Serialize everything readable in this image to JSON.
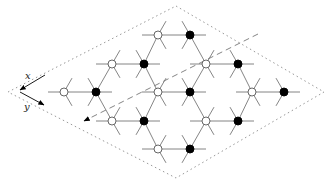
{
  "diagram": {
    "type": "honeycomb-lattice",
    "axis_labels": {
      "x": "x",
      "y": "y"
    },
    "colors": {
      "edge": "#777777",
      "boundary": "#999999",
      "dashed_line": "#777777",
      "filled_node": "#000000",
      "open_node_fill": "#ffffff",
      "open_node_stroke": "#555555",
      "arrow": "#000000"
    },
    "boundary_rhombus": [
      [
        176,
        6
      ],
      [
        324,
        92
      ],
      [
        176,
        178
      ],
      [
        8,
        92
      ]
    ],
    "nodes": [
      {
        "x": 158,
        "y": 35,
        "filled": false
      },
      {
        "x": 190,
        "y": 35,
        "filled": true
      },
      {
        "x": 112,
        "y": 64,
        "filled": false
      },
      {
        "x": 144,
        "y": 64,
        "filled": true
      },
      {
        "x": 206,
        "y": 64,
        "filled": false
      },
      {
        "x": 238,
        "y": 64,
        "filled": true
      },
      {
        "x": 64,
        "y": 92,
        "filled": false
      },
      {
        "x": 96,
        "y": 92,
        "filled": true
      },
      {
        "x": 158,
        "y": 92,
        "filled": false
      },
      {
        "x": 190,
        "y": 92,
        "filled": true
      },
      {
        "x": 252,
        "y": 92,
        "filled": false
      },
      {
        "x": 284,
        "y": 92,
        "filled": true
      },
      {
        "x": 112,
        "y": 121,
        "filled": false
      },
      {
        "x": 144,
        "y": 121,
        "filled": true
      },
      {
        "x": 206,
        "y": 121,
        "filled": false
      },
      {
        "x": 238,
        "y": 121,
        "filled": true
      },
      {
        "x": 158,
        "y": 149,
        "filled": false
      },
      {
        "x": 190,
        "y": 149,
        "filled": true
      }
    ],
    "dashed_arrow": {
      "from": [
        258,
        34
      ],
      "to": [
        84,
        121
      ]
    }
  }
}
